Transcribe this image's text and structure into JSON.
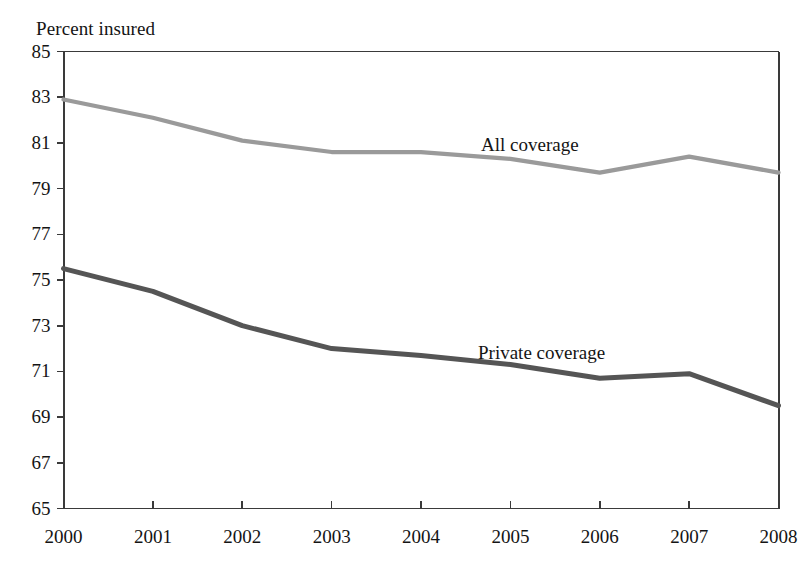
{
  "chart_data": {
    "type": "line",
    "title": "",
    "xlabel": "",
    "ylabel": "Percent insured",
    "ylim": [
      65,
      85
    ],
    "ytick_step": 2,
    "yticks": [
      85,
      83,
      81,
      79,
      77,
      75,
      73,
      71,
      69,
      67,
      65
    ],
    "grid": false,
    "legend_position": "inline-annotation",
    "categories": [
      "2000",
      "2001",
      "2002",
      "2003",
      "2004",
      "2005",
      "2006",
      "2007",
      "2008"
    ],
    "x": [
      2000,
      2001,
      2002,
      2003,
      2004,
      2005,
      2006,
      2007,
      2008
    ],
    "series": [
      {
        "name": "All coverage",
        "color": "#9a9a9a",
        "label_text": "All coverage",
        "values": [
          82.9,
          82.1,
          81.1,
          80.6,
          80.6,
          80.3,
          79.7,
          80.4,
          79.7
        ]
      },
      {
        "name": "Private coverage",
        "color": "#555555",
        "label_text": "Private coverage",
        "values": [
          75.5,
          74.5,
          73.0,
          72.0,
          71.7,
          71.3,
          70.7,
          70.9,
          69.5
        ]
      }
    ],
    "annotations": [
      {
        "text": "All coverage",
        "x": 481,
        "y": 134
      },
      {
        "text": "Private coverage",
        "x": 478,
        "y": 342
      }
    ],
    "axis_color": "#3a3a3a"
  },
  "axis": {
    "ylabel": "Percent insured"
  }
}
